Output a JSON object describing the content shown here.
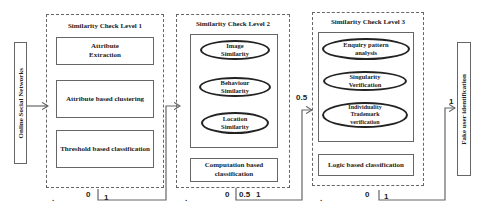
{
  "input_node": {
    "label": "Online Social Networks"
  },
  "output_node": {
    "label": "Fake user identification"
  },
  "levels": [
    {
      "title": "Similarity Check Level 1",
      "boxes": [
        "Attribute\nExtraction",
        "Attribute based clustering",
        "Threshold based classification"
      ],
      "outputs": {
        "dot": ".",
        "zero": "0",
        "one": "1"
      }
    },
    {
      "title": "Similarity Check Level 2",
      "ellipses": [
        "Image\nSimilarity",
        "Behaviour\nSimilarity",
        "Location\nSimilarity"
      ],
      "classifier": "Computation based\nclassification",
      "outputs": {
        "dot": ".",
        "zero": "0",
        "half": "0.5",
        "one": "1"
      }
    },
    {
      "title": "Similarity Check Level 3",
      "ellipses": [
        "Enquiry pattern\nanalysis",
        "Singularity\nVerification",
        "Individuality\nTrademark\nverification"
      ],
      "classifier": "Logic based classification",
      "outputs": {
        "dot": ".",
        "zero": "0",
        "one": "1"
      }
    }
  ],
  "edge_labels": {
    "to_level3": "0.5",
    "to_output": "1"
  },
  "colors": {
    "line": "#666666",
    "ellipse_border": "#222222"
  }
}
